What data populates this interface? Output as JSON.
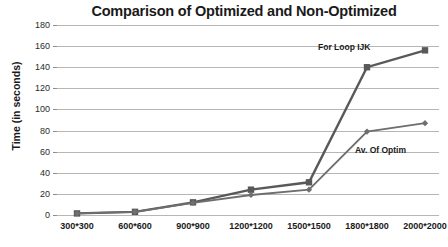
{
  "chart_data": {
    "type": "line",
    "title": "Comparison of Optimized and Non-Optimized",
    "xlabel": "",
    "ylabel": "Time (in seconds)",
    "categories": [
      "300*300",
      "600*600",
      "900*900",
      "1200*1200",
      "1500*1500",
      "1800*1800",
      "2000*2000"
    ],
    "yticks": [
      0,
      20,
      40,
      60,
      80,
      100,
      120,
      140,
      160,
      180
    ],
    "ylim": [
      0,
      180
    ],
    "grid": "horizontal",
    "legend_position": "inline-annotations",
    "series": [
      {
        "name": "For Loop IJK",
        "marker": "square",
        "color": "#595959",
        "values": [
          1.5,
          3,
          12,
          24,
          31,
          140,
          156
        ]
      },
      {
        "name": "Av. Of Optim",
        "marker": "diamond",
        "color": "#6e6e6e",
        "values": [
          1.5,
          3,
          11.5,
          19,
          24,
          79,
          87
        ]
      }
    ],
    "annotations": [
      {
        "text": "For Loop IJK"
      },
      {
        "text": "Av. Of Optim"
      }
    ]
  },
  "colors": {
    "gridline": "#b6b6b6",
    "text": "#1a1a1a",
    "background": "#ffffff"
  }
}
